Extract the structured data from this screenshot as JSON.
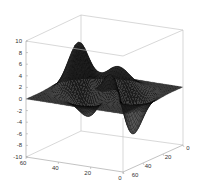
{
  "chart_data": {
    "type": "surface",
    "title": "",
    "xlabel": "",
    "ylabel": "",
    "zlabel": "",
    "function": "peaks",
    "grid_size": 49,
    "x_ticks": [
      "60",
      "40",
      "20",
      "0"
    ],
    "y_ticks": [
      "60",
      "40",
      "20",
      "0"
    ],
    "z_ticks": [
      "10",
      "8",
      "6",
      "4",
      "2",
      "0",
      "-2",
      "-4",
      "-6",
      "-8",
      "-10"
    ],
    "xlim": [
      0,
      60
    ],
    "ylim": [
      0,
      60
    ],
    "zlim": [
      -10,
      10
    ],
    "grid": false,
    "box": true,
    "colormap": "gray-dark",
    "features": {
      "max_peak": {
        "z": 8.1
      },
      "secondary_peak": {
        "z": 3.8
      },
      "min_trough": {
        "z": -6.5
      },
      "secondary_trough": {
        "z": -3.0
      }
    },
    "surface_color": "#1a1a1a",
    "edge_color": "#000000",
    "highlight_color": "#8a8a8a"
  }
}
